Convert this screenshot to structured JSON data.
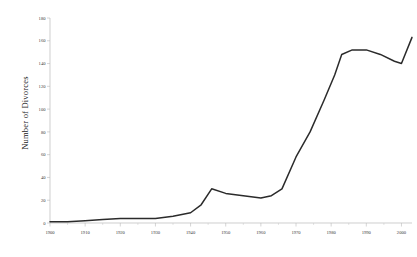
{
  "chart_data": {
    "type": "line",
    "title": "",
    "xlabel": "",
    "ylabel": "Number of Divorces",
    "xlim": [
      1900,
      2003
    ],
    "ylim": [
      0,
      180
    ],
    "ytick_step": 20,
    "xtick_step": 10,
    "grid": false,
    "legend": null,
    "ytick_labels": [
      "0",
      "20",
      "40",
      "60",
      "80",
      "100",
      "120",
      "140",
      "160",
      "180"
    ],
    "ytick_values": [
      0,
      20,
      40,
      60,
      80,
      100,
      120,
      140,
      160,
      180
    ],
    "xtick_labels": [
      "1900",
      "1910",
      "1920",
      "1930",
      "1940",
      "1950",
      "1960",
      "1970",
      "1980",
      "1990",
      "2000"
    ],
    "xtick_values": [
      1900,
      1910,
      1920,
      1930,
      1940,
      1950,
      1960,
      1970,
      1980,
      1990,
      2000
    ],
    "series": [
      {
        "name": "Number of Divorces",
        "color": "#2b2b2b",
        "x": [
          1900,
          1905,
          1910,
          1915,
          1920,
          1925,
          1930,
          1935,
          1940,
          1943,
          1946,
          1950,
          1955,
          1960,
          1963,
          1966,
          1970,
          1974,
          1978,
          1981,
          1983,
          1986,
          1990,
          1994,
          1998,
          2000,
          2003
        ],
        "y": [
          1,
          1,
          2,
          3,
          4,
          4,
          4,
          6,
          9,
          16,
          30,
          26,
          24,
          22,
          24,
          30,
          58,
          80,
          108,
          130,
          148,
          152,
          152,
          148,
          142,
          140,
          163
        ]
      }
    ]
  }
}
